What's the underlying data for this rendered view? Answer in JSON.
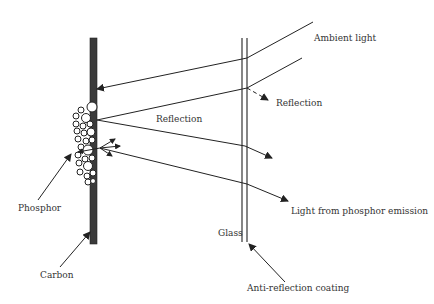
{
  "diagram": {
    "type": "light-path-schematic",
    "colors": {
      "line": "#222222",
      "carbon": "#3a3a3a",
      "text": "#333333",
      "background": "#ffffff"
    },
    "labels": {
      "ambient_light": "Ambient light",
      "reflection_glass": "Reflection",
      "reflection_phosphor": "Reflection",
      "phosphor": "Phosphor",
      "carbon": "Carbon",
      "glass": "Glass",
      "light_emission": "Light from phosphor emission",
      "anti_reflection": "Anti-reflection coating"
    }
  }
}
